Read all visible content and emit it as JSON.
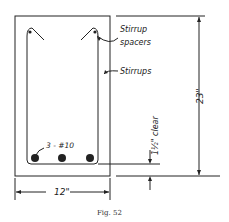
{
  "figure": {
    "caption": "Fig. 52",
    "labels": {
      "stirrup_spacers_line1": "Stirrup",
      "stirrup_spacers_line2": "spacers",
      "stirrups": "Stirrups",
      "bars": "3 - #10",
      "height": "23\"",
      "width": "12\"",
      "clear_cover": "1½\" clear"
    },
    "colors": {
      "ink": "#222222",
      "background": "#ffffff"
    }
  }
}
